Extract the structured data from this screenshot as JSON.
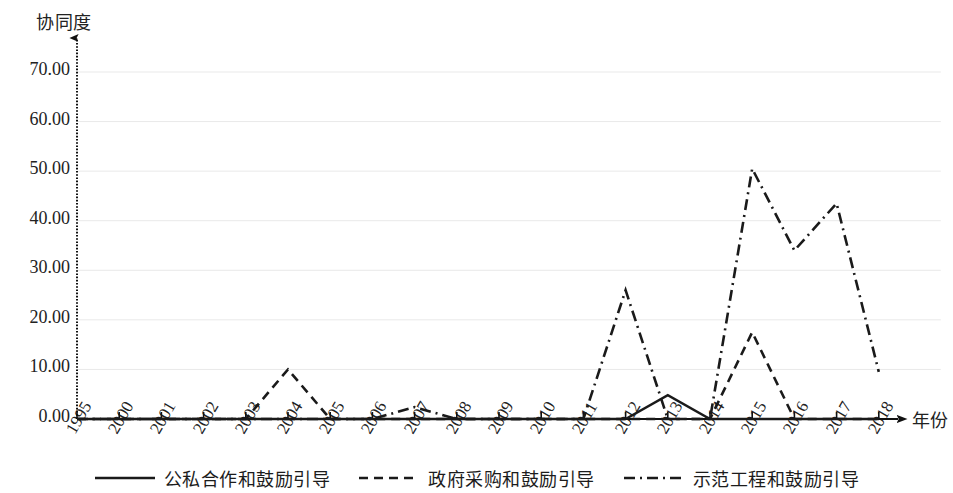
{
  "chart_data": {
    "type": "line",
    "title": "",
    "subtitle": "",
    "xlabel": "年份",
    "ylabel": "协同度",
    "categories": [
      "1995",
      "2000",
      "2001",
      "2002",
      "2003",
      "2004",
      "2005",
      "2006",
      "2007",
      "2008",
      "2009",
      "2010",
      "2011",
      "2012",
      "2013",
      "2014",
      "2015",
      "2016",
      "2017",
      "2018"
    ],
    "ylim": [
      0,
      70
    ],
    "yticks": [
      "0.00",
      "10.00",
      "20.00",
      "30.00",
      "40.00",
      "50.00",
      "60.00",
      "70.00"
    ],
    "ytick_values": [
      0,
      10,
      20,
      30,
      40,
      50,
      60,
      70
    ],
    "grid": true,
    "legend_position": "bottom",
    "series": [
      {
        "name": "公私合作和鼓励引导",
        "style": "solid",
        "color": "#1a1a1a",
        "values": [
          0,
          0,
          0,
          0,
          0,
          0,
          0,
          0,
          0,
          0,
          0,
          0,
          0,
          0,
          4.8,
          0,
          0,
          0,
          0,
          0
        ]
      },
      {
        "name": "政府采购和鼓励引导",
        "style": "dashed",
        "color": "#1a1a1a",
        "values": [
          0,
          0,
          0,
          0,
          0,
          10.0,
          0,
          0,
          0,
          0,
          0,
          0,
          0,
          0,
          0,
          0,
          17.5,
          0,
          0,
          0
        ]
      },
      {
        "name": "示范工程和鼓励引导",
        "style": "dashdot",
        "color": "#1a1a1a",
        "values": [
          0,
          0,
          0,
          0,
          0,
          0,
          0,
          0,
          2.4,
          0,
          0,
          0,
          0,
          26.0,
          0,
          0,
          50.5,
          34.0,
          43.5,
          9.5
        ]
      }
    ]
  },
  "axes": {
    "y_axis_title": "协同度",
    "x_axis_title": "年份"
  },
  "legend": {
    "items": [
      {
        "label": "公私合作和鼓励引导",
        "style": "solid"
      },
      {
        "label": "政府采购和鼓励引导",
        "style": "dashed"
      },
      {
        "label": "示范工程和鼓励引导",
        "style": "dashdot"
      }
    ]
  },
  "colors": {
    "line": "#1a1a1a",
    "grid": "#e9e9e9",
    "axis": "#111111",
    "background": "#ffffff"
  }
}
